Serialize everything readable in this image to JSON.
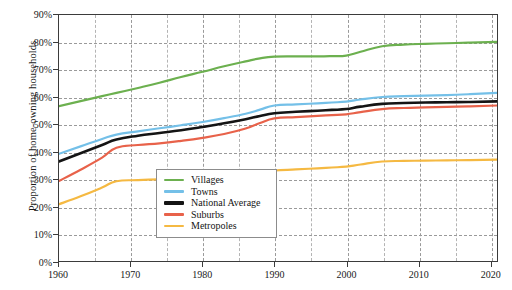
{
  "chart_data": {
    "type": "line",
    "title": "",
    "xlabel": "",
    "ylabel": "Proportion of home-owning households",
    "xlim": [
      1960,
      2021
    ],
    "ylim": [
      0,
      90
    ],
    "grid": true,
    "legend_position": "bottom-center",
    "y_ticks": [
      "0%",
      "10%",
      "20%",
      "30%",
      "40%",
      "50%",
      "60%",
      "70%",
      "80%",
      "90%"
    ],
    "y_tick_values": [
      0,
      10,
      20,
      30,
      40,
      50,
      60,
      70,
      80,
      90
    ],
    "x_ticks": [
      "1960",
      "1970",
      "1980",
      "1990",
      "2000",
      "2010",
      "2020"
    ],
    "x_tick_values": [
      1960,
      1970,
      1980,
      1990,
      2000,
      2010,
      2020
    ],
    "x_minor_values": [
      1965,
      1975,
      1985,
      1995,
      2005,
      2015
    ],
    "series": [
      {
        "name": "Villages",
        "color": "#6cb04f",
        "width": 2.2,
        "x": [
          1960,
          1963,
          1966,
          1968,
          1971,
          1974,
          1977,
          1980,
          1983,
          1986,
          1988,
          1990,
          1993,
          1996,
          1998,
          2000,
          2002,
          2005,
          2008,
          2011,
          2014,
          2017,
          2021
        ],
        "values": [
          56.8,
          58.6,
          60.4,
          61.6,
          63.4,
          65.3,
          67.4,
          69.3,
          71.3,
          73.1,
          74.2,
          74.8,
          74.9,
          74.9,
          75.0,
          75.2,
          76.6,
          78.6,
          79.2,
          79.5,
          79.7,
          79.9,
          80.2
        ]
      },
      {
        "name": "Towns",
        "color": "#74c0e8",
        "width": 2.2,
        "x": [
          1960,
          1963,
          1966,
          1968,
          1971,
          1974,
          1977,
          1980,
          1983,
          1986,
          1988,
          1990,
          1993,
          1996,
          1998,
          2000,
          2002,
          2005,
          2008,
          2011,
          2014,
          2017,
          2021
        ],
        "values": [
          39.4,
          42.1,
          44.8,
          46.4,
          47.6,
          48.7,
          49.8,
          51.0,
          52.4,
          54.0,
          55.5,
          57.0,
          57.4,
          57.8,
          58.1,
          58.4,
          59.2,
          60.1,
          60.4,
          60.6,
          60.8,
          61.1,
          61.6
        ]
      },
      {
        "name": "National Average",
        "color": "#141414",
        "width": 2.6,
        "x": [
          1960,
          1963,
          1966,
          1968,
          1971,
          1974,
          1977,
          1980,
          1983,
          1986,
          1988,
          1990,
          1993,
          1996,
          1998,
          2000,
          2002,
          2005,
          2008,
          2011,
          2014,
          2017,
          2021
        ],
        "values": [
          36.6,
          39.6,
          42.6,
          44.6,
          46.0,
          47.0,
          48.0,
          49.2,
          50.5,
          52.0,
          53.2,
          54.2,
          54.7,
          55.1,
          55.4,
          55.7,
          56.6,
          57.6,
          57.9,
          58.1,
          58.2,
          58.3,
          58.5
        ]
      },
      {
        "name": "Suburbs",
        "color": "#e8624a",
        "width": 2.2,
        "x": [
          1960,
          1963,
          1966,
          1968,
          1971,
          1974,
          1977,
          1980,
          1983,
          1986,
          1988,
          1990,
          1993,
          1996,
          1998,
          2000,
          2002,
          2005,
          2008,
          2011,
          2014,
          2017,
          2021
        ],
        "values": [
          29.5,
          33.6,
          38.0,
          41.6,
          42.6,
          43.2,
          44.1,
          45.2,
          46.6,
          48.6,
          50.6,
          52.3,
          52.8,
          53.2,
          53.5,
          53.8,
          54.6,
          55.7,
          56.1,
          56.3,
          56.5,
          56.7,
          57.0
        ]
      },
      {
        "name": "Metropoles",
        "color": "#f5b942",
        "width": 2.2,
        "x": [
          1960,
          1963,
          1966,
          1968,
          1971,
          1974,
          1977,
          1980,
          1983,
          1986,
          1988,
          1990,
          1993,
          1996,
          1998,
          2000,
          2002,
          2005,
          2008,
          2011,
          2014,
          2017,
          2021
        ],
        "values": [
          21.0,
          23.9,
          27.1,
          29.4,
          29.8,
          30.1,
          30.5,
          30.9,
          31.5,
          32.2,
          32.7,
          33.3,
          33.7,
          34.1,
          34.4,
          34.7,
          35.5,
          36.6,
          36.8,
          36.9,
          37.0,
          37.1,
          37.3
        ]
      }
    ]
  },
  "legend": {
    "items": [
      {
        "label": "Villages"
      },
      {
        "label": "Towns"
      },
      {
        "label": "National Average"
      },
      {
        "label": "Suburbs"
      },
      {
        "label": "Metropoles"
      }
    ]
  }
}
